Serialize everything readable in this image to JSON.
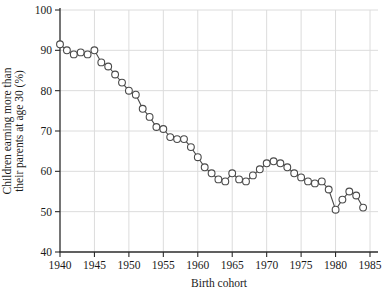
{
  "chart_data": {
    "type": "line",
    "title": "",
    "xlabel": "Birth cohort",
    "ylabel": "Children earning more than their parents at age 30 (%)",
    "ylabel_line1": "Children earning more than",
    "ylabel_line2": "their parents at age 30 (%)",
    "x": [
      1940,
      1941,
      1942,
      1943,
      1944,
      1945,
      1946,
      1947,
      1948,
      1949,
      1950,
      1951,
      1952,
      1953,
      1954,
      1955,
      1956,
      1957,
      1958,
      1959,
      1960,
      1961,
      1962,
      1963,
      1964,
      1965,
      1966,
      1967,
      1968,
      1969,
      1970,
      1971,
      1972,
      1973,
      1974,
      1975,
      1976,
      1977,
      1978,
      1979,
      1980,
      1981,
      1982,
      1983,
      1984
    ],
    "values": [
      91.5,
      90,
      89,
      89.5,
      89,
      90,
      87,
      86,
      84,
      82,
      80,
      79,
      75.5,
      73.5,
      71,
      70.5,
      68.5,
      68,
      68,
      66,
      63.5,
      61,
      59.5,
      58,
      57.5,
      59.5,
      58,
      57.5,
      59,
      60.5,
      62,
      62.5,
      62,
      61,
      59.5,
      58.5,
      57.5,
      57,
      57.5,
      55.5,
      50.5,
      53,
      55,
      54,
      51
    ],
    "xlim": [
      1940,
      1985
    ],
    "ylim": [
      40,
      100
    ],
    "xticks": [
      1940,
      1945,
      1950,
      1955,
      1960,
      1965,
      1970,
      1975,
      1980,
      1985
    ],
    "yticks": [
      40,
      50,
      60,
      70,
      80,
      90,
      100
    ],
    "grid": true,
    "legend": "none",
    "marker": "open-circle",
    "colors": {
      "line": "#4a4a4a",
      "marker_stroke": "#4a4a4a",
      "marker_fill": "#ffffff",
      "grid": "#dcdcdc",
      "axis": "#2b2b2b",
      "text": "#1a1a1a",
      "background": "#ffffff"
    }
  }
}
